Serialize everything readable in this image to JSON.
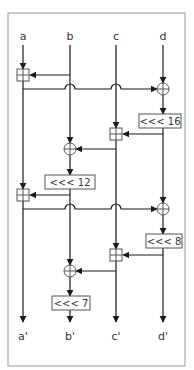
{
  "diagram": {
    "inputs": [
      "a",
      "b",
      "c",
      "d"
    ],
    "outputs": [
      "a'",
      "b'",
      "c'",
      "d'"
    ],
    "rotations": {
      "r1": "<<< 16",
      "r2": "<<< 12",
      "r3": "<<< 8",
      "r4": "<<< 7"
    },
    "operations": [
      {
        "op": "add",
        "target": "a",
        "source": "b"
      },
      {
        "op": "xor",
        "target": "d",
        "source": "a"
      },
      {
        "op": "rotate",
        "target": "d",
        "amount": "<<< 16"
      },
      {
        "op": "add",
        "target": "c",
        "source": "d"
      },
      {
        "op": "xor",
        "target": "b",
        "source": "c"
      },
      {
        "op": "rotate",
        "target": "b",
        "amount": "<<< 12"
      },
      {
        "op": "add",
        "target": "a",
        "source": "b"
      },
      {
        "op": "xor",
        "target": "d",
        "source": "a"
      },
      {
        "op": "rotate",
        "target": "d",
        "amount": "<<< 8"
      },
      {
        "op": "add",
        "target": "c",
        "source": "d"
      },
      {
        "op": "xor",
        "target": "b",
        "source": "c"
      },
      {
        "op": "rotate",
        "target": "b",
        "amount": "<<< 7"
      }
    ],
    "colors": {
      "line": "#1a1a1a",
      "frame": "#999999",
      "box_border": "#555555",
      "text": "#333333"
    }
  }
}
